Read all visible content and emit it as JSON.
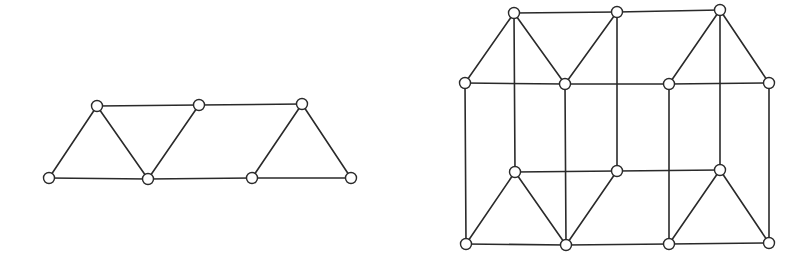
{
  "figure": {
    "style": {
      "edge_color": "#2a2a2a",
      "node_fill": "#ffffff",
      "node_stroke": "#2a2a2a",
      "node_radius": 5.5,
      "background": "#ffffff"
    },
    "graphs": [
      {
        "name": "left-graph",
        "nodes": [
          {
            "id": "a1",
            "x": 97,
            "y": 106
          },
          {
            "id": "a2",
            "x": 199,
            "y": 105
          },
          {
            "id": "a3",
            "x": 302,
            "y": 104
          },
          {
            "id": "b1",
            "x": 49,
            "y": 178
          },
          {
            "id": "b2",
            "x": 148,
            "y": 179
          },
          {
            "id": "b3",
            "x": 252,
            "y": 178
          },
          {
            "id": "b4",
            "x": 351,
            "y": 178
          }
        ],
        "edges": [
          [
            "a1",
            "a2"
          ],
          [
            "a2",
            "a3"
          ],
          [
            "b1",
            "b2"
          ],
          [
            "b2",
            "b3"
          ],
          [
            "b3",
            "b4"
          ],
          [
            "a1",
            "b1"
          ],
          [
            "a1",
            "b2"
          ],
          [
            "a2",
            "b2"
          ],
          [
            "a3",
            "b3"
          ],
          [
            "a3",
            "b4"
          ]
        ]
      },
      {
        "name": "right-graph",
        "nodes": [
          {
            "id": "p1",
            "x": 514,
            "y": 13
          },
          {
            "id": "p2",
            "x": 617,
            "y": 12
          },
          {
            "id": "p3",
            "x": 720,
            "y": 10
          },
          {
            "id": "q1",
            "x": 465,
            "y": 83
          },
          {
            "id": "q2",
            "x": 565,
            "y": 84
          },
          {
            "id": "q3",
            "x": 669,
            "y": 84
          },
          {
            "id": "q4",
            "x": 769,
            "y": 83
          },
          {
            "id": "r1",
            "x": 515,
            "y": 172
          },
          {
            "id": "r2",
            "x": 617,
            "y": 171
          },
          {
            "id": "r3",
            "x": 720,
            "y": 170
          },
          {
            "id": "s1",
            "x": 466,
            "y": 244
          },
          {
            "id": "s2",
            "x": 566,
            "y": 245
          },
          {
            "id": "s3",
            "x": 669,
            "y": 244
          },
          {
            "id": "s4",
            "x": 769,
            "y": 243
          }
        ],
        "edges": [
          [
            "p1",
            "p2"
          ],
          [
            "p2",
            "p3"
          ],
          [
            "q1",
            "q2"
          ],
          [
            "q2",
            "q3"
          ],
          [
            "q3",
            "q4"
          ],
          [
            "p1",
            "q1"
          ],
          [
            "p1",
            "q2"
          ],
          [
            "p2",
            "q2"
          ],
          [
            "p3",
            "q3"
          ],
          [
            "p3",
            "q4"
          ],
          [
            "r1",
            "r2"
          ],
          [
            "r2",
            "r3"
          ],
          [
            "s1",
            "s2"
          ],
          [
            "s2",
            "s3"
          ],
          [
            "s3",
            "s4"
          ],
          [
            "r1",
            "s1"
          ],
          [
            "r1",
            "s2"
          ],
          [
            "r2",
            "s2"
          ],
          [
            "r3",
            "s3"
          ],
          [
            "r3",
            "s4"
          ],
          [
            "p1",
            "r1"
          ],
          [
            "p2",
            "r2"
          ],
          [
            "p3",
            "r3"
          ],
          [
            "q1",
            "s1"
          ],
          [
            "q2",
            "s2"
          ],
          [
            "q3",
            "s3"
          ],
          [
            "q4",
            "s4"
          ]
        ]
      }
    ]
  }
}
